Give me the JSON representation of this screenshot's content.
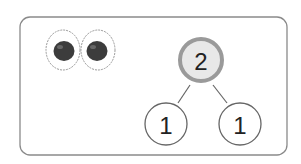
{
  "diagram": {
    "type": "number-bond",
    "items_shown": {
      "name": "tomato",
      "count": 2
    },
    "whole": "2",
    "parts": [
      "1",
      "1"
    ],
    "colors": {
      "frame": "#8a8a8a",
      "whole_fill": "#e8e8e8",
      "whole_ring": "#9a9a9a",
      "part_ring": "#666666",
      "fruit": "#3c3c3c"
    }
  }
}
